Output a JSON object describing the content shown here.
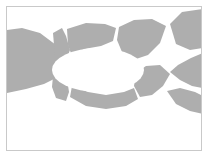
{
  "figure": {
    "domain_kind": "diagram",
    "title": "",
    "caption": "",
    "description": "Grayscale segmented band forming a closed loop around a central white lens-shaped void, with branching arms extending to the left and right edges of the frame.",
    "background_color": "#ffffff",
    "frame_color": "#c9c9c9",
    "fill_color": "#aeaeae",
    "seam_color": "#ffffff",
    "frame": {
      "x": 6,
      "y": 6,
      "width": 196,
      "height": 145,
      "border_width": 1
    },
    "canvas": {
      "width": 210,
      "height": 158
    },
    "void": {
      "name": "central-lens-void",
      "center_x": 98,
      "center_y": 70,
      "radius_x": 46,
      "radius_y": 22,
      "fill": "#ffffff"
    },
    "segment_count": 9,
    "segments": [
      {
        "id": "segment-left-arm",
        "label": "left arm",
        "fill": "#aeaeae",
        "points": "7,30 22,28 40,33 56,45 60,55 55,64 56,78 44,84 26,89 7,93 7,30"
      },
      {
        "id": "segment-upper-left",
        "label": "upper left",
        "fill": "#aeaeae",
        "points": "53,33 62,28 66,36 70,50 66,61 59,65 55,57 54,45"
      },
      {
        "id": "segment-upper-middle",
        "label": "upper middle",
        "fill": "#aeaeae",
        "points": "67,29 86,23 105,24 116,28 113,41 101,46 84,49 72,56 68,45"
      },
      {
        "id": "segment-upper-right",
        "label": "upper right",
        "fill": "#aeaeae",
        "points": "119,27 134,20 152,19 166,26 160,43 148,55 133,60 122,52 117,40"
      },
      {
        "id": "segment-top-right-corner",
        "label": "top right corner",
        "fill": "#aeaeae",
        "points": "170,24 182,12 203,9 203,48 190,50 176,44"
      },
      {
        "id": "segment-right-middle",
        "label": "right middle",
        "fill": "#aeaeae",
        "points": "203,53 191,58 178,65 170,72 180,80 192,86 203,88"
      },
      {
        "id": "segment-lower-right",
        "label": "lower right",
        "fill": "#aeaeae",
        "points": "146,66 160,65 170,74 163,86 152,95 140,97 134,86 136,73"
      },
      {
        "id": "segment-right-tail",
        "label": "right tail",
        "fill": "#aeaeae",
        "points": "167,91 180,88 195,92 203,96 203,114 190,111 176,104"
      },
      {
        "id": "segment-lower-middle",
        "label": "lower middle",
        "fill": "#aeaeae",
        "points": "72,86 88,92 106,95 124,92 134,88 138,99 126,106 106,109 86,106 70,97"
      },
      {
        "id": "segment-lower-left",
        "label": "lower left",
        "fill": "#aeaeae",
        "points": "59,72 67,79 69,92 66,101 56,98 52,87 53,76"
      }
    ]
  }
}
